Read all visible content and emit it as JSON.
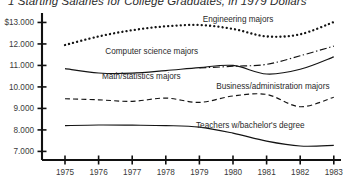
{
  "chart_data": {
    "type": "line",
    "title": "Starting Salaries for College Graduates, in 1979 Dollars",
    "title_prefix": "1",
    "xlabel": "",
    "ylabel": "",
    "grid": false,
    "legend_position": "inline-annotations",
    "xlim": [
      1974.6,
      1983.4
    ],
    "ylim": [
      6600,
      13300
    ],
    "x": [
      1975,
      1976,
      1977,
      1978,
      1979,
      1980,
      1981,
      1982,
      1983
    ],
    "xtick_labels": [
      "1975",
      "1976",
      "1977",
      "1978",
      "1979",
      "1980",
      "1981",
      "1982",
      "1983"
    ],
    "ytick_values": [
      13000,
      12000,
      11000,
      10000,
      9000,
      8000,
      7000
    ],
    "ytick_labels": [
      "$13.000",
      "12.000",
      "11.000",
      "10.000",
      "9.000",
      "8.000",
      "7.000"
    ],
    "series": [
      {
        "name": "Engineering majors",
        "label": "Engineering majors",
        "style": "dotted",
        "color": "#141414",
        "values": [
          11950,
          12350,
          12640,
          12820,
          12880,
          12700,
          12350,
          12450,
          13020
        ]
      },
      {
        "name": "Computer science majors",
        "label": "Computer science majors",
        "style": "dashdot",
        "color": "#141414",
        "values": [
          null,
          null,
          null,
          null,
          10880,
          10960,
          11050,
          11450,
          11900
        ]
      },
      {
        "name": "Math/statistics majors",
        "label": "Math/statistics majors",
        "style": "solid",
        "color": "#141414",
        "values": [
          10850,
          10650,
          10640,
          10760,
          10900,
          11000,
          10600,
          10820,
          11400
        ]
      },
      {
        "name": "Business/administration majors",
        "label": "Business/administration majors",
        "style": "dashed",
        "color": "#141414",
        "values": [
          9450,
          9400,
          9330,
          9480,
          9280,
          9580,
          9650,
          9080,
          9520
        ]
      },
      {
        "name": "Teachers w/bachelor's degree",
        "label": "Teachers w/bachelor's degree",
        "style": "solid",
        "color": "#141414",
        "values": [
          8200,
          8230,
          8220,
          8200,
          8130,
          7850,
          7480,
          7250,
          7280
        ]
      }
    ],
    "annotations": [
      {
        "text": "Engineering majors",
        "x": 1979.1,
        "y": 13040
      },
      {
        "text": "Computer science majors",
        "x": 1976.2,
        "y": 11520
      },
      {
        "text": "Math/statistics majors",
        "x": 1976.1,
        "y": 10350
      },
      {
        "text": "Business/administration majors",
        "x": 1979.5,
        "y": 9890
      },
      {
        "text": "Teachers w/bachelor's degree",
        "x": 1978.9,
        "y": 8100
      }
    ]
  }
}
